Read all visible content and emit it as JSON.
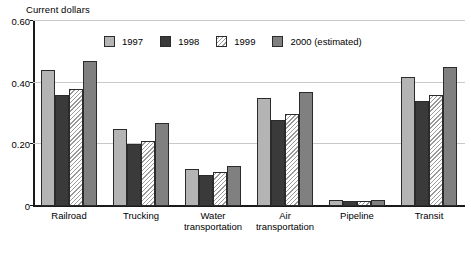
{
  "chart_data": {
    "type": "bar",
    "title": "Current dollars",
    "xlabel": "",
    "ylabel": "Current dollars",
    "ylim": [
      0,
      0.6
    ],
    "yticks": [
      "0",
      "0.20",
      "0.40",
      "0.60"
    ],
    "ytick_values": [
      0,
      0.2,
      0.4,
      0.6
    ],
    "grid": true,
    "legend_position": "top-center",
    "categories": [
      "Railroad",
      "Trucking",
      "Water transportation",
      "Air transportation",
      "Pipeline",
      "Transit"
    ],
    "category_labels": [
      "Railroad",
      "Trucking",
      "Water\ntransportation",
      "Air\ntransportation",
      "Pipeline",
      "Transit"
    ],
    "series": [
      {
        "name": "1997",
        "color": "#b4b4b4",
        "values": [
          0.44,
          0.25,
          0.12,
          0.35,
          0.02,
          0.42
        ]
      },
      {
        "name": "1998",
        "color": "#3a3a3a",
        "values": [
          0.36,
          0.2,
          0.1,
          0.28,
          0.015,
          0.34
        ]
      },
      {
        "name": "1999",
        "color": "#ffffff",
        "values": [
          0.38,
          0.21,
          0.11,
          0.3,
          0.015,
          0.36
        ]
      },
      {
        "name": "2000 (estimated)",
        "color": "#808080",
        "values": [
          0.47,
          0.27,
          0.13,
          0.37,
          0.02,
          0.45
        ]
      }
    ]
  },
  "legend": {
    "items": [
      {
        "label": "1997"
      },
      {
        "label": "1998"
      },
      {
        "label": "1999"
      },
      {
        "label": "2000 (estimated)"
      }
    ]
  },
  "colors": {
    "series_1997": "#b4b4b4",
    "series_1998": "#3a3a3a",
    "series_1999": "#ffffff",
    "series_2000": "#808080",
    "axis": "#1a1a1a",
    "gridline": "#c9c9c9",
    "background": "#ffffff"
  }
}
